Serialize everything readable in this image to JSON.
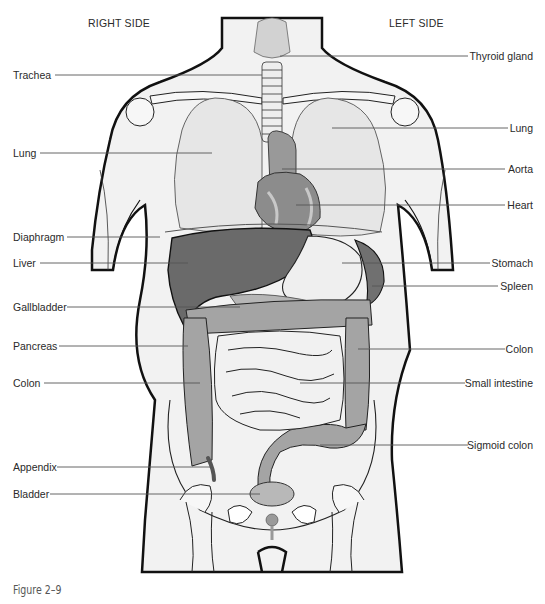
{
  "headers": {
    "right_side": "RIGHT SIDE",
    "left_side": "LEFT SIDE"
  },
  "labels_left": [
    {
      "text": "Trachea",
      "y": 75
    },
    {
      "text": "Lung",
      "y": 153
    },
    {
      "text": "Diaphragm",
      "y": 237
    },
    {
      "text": "Liver",
      "y": 263
    },
    {
      "text": "Gallbladder",
      "y": 307
    },
    {
      "text": "Pancreas",
      "y": 346
    },
    {
      "text": "Colon",
      "y": 383
    },
    {
      "text": "Appendix",
      "y": 467
    },
    {
      "text": "Bladder",
      "y": 494
    }
  ],
  "labels_right": [
    {
      "text": "Thyroid gland",
      "y": 56
    },
    {
      "text": "Lung",
      "y": 128
    },
    {
      "text": "Aorta",
      "y": 169
    },
    {
      "text": "Heart",
      "y": 205
    },
    {
      "text": "Stomach",
      "y": 263
    },
    {
      "text": "Spleen",
      "y": 286
    },
    {
      "text": "Colon",
      "y": 349
    },
    {
      "text": "Small intestine",
      "y": 383
    },
    {
      "text": "Sigmoid colon",
      "y": 445
    }
  ],
  "caption": "Figure 2–9",
  "colors": {
    "skin": "#f2f2f2",
    "outline": "#111111",
    "lung": "#e6e6e6",
    "heart": "#8c8c8c",
    "liver": "#6a6a6a",
    "spleen": "#707070",
    "stomach": "#efefef",
    "colon": "#a4a4a4",
    "intestine": "#f1f1f1",
    "bladder": "#b8b8b8",
    "leader_line": "#555555"
  }
}
